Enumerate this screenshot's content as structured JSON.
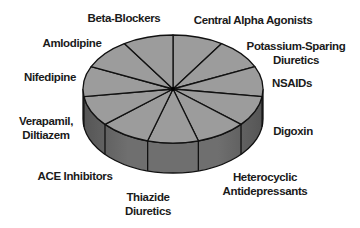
{
  "chart_data": {
    "type": "pie",
    "style": "3d",
    "title": "",
    "categories": [
      "Central Alpha Agonists",
      "Potassium-Sparing Diuretics",
      "NSAIDs",
      "Digoxin",
      "Heterocyclic Antidepressants",
      "Thiazide Diuretics",
      "ACE Inhibitors",
      "Verapamil, Diltiazem",
      "Nifedipine",
      "Amlodipine",
      "Beta-Blockers"
    ],
    "values": [
      1,
      1,
      1,
      1,
      1,
      1,
      1,
      1,
      1,
      1,
      1
    ],
    "labels": [
      {
        "lines": [
          "Central Alpha Agonists"
        ]
      },
      {
        "lines": [
          "Potassium-Sparing",
          "Diuretics"
        ]
      },
      {
        "lines": [
          "NSAIDs"
        ]
      },
      {
        "lines": [
          "Digoxin"
        ]
      },
      {
        "lines": [
          "Heterocyclic",
          "Antidepressants"
        ]
      },
      {
        "lines": [
          "Thiazide",
          "Diuretics"
        ]
      },
      {
        "lines": [
          "ACE Inhibitors"
        ]
      },
      {
        "lines": [
          "Verapamil,",
          "Diltiazem"
        ]
      },
      {
        "lines": [
          "Nifedipine"
        ]
      },
      {
        "lines": [
          "Amlodipine"
        ]
      },
      {
        "lines": [
          "Beta-Blockers"
        ]
      }
    ],
    "colors": {
      "top": "#9c9c9c",
      "side": "#6f6f6f",
      "side_dark": "#5a5a5a",
      "line": "#111111",
      "text": "#1a1a1a"
    },
    "legend": "none"
  }
}
